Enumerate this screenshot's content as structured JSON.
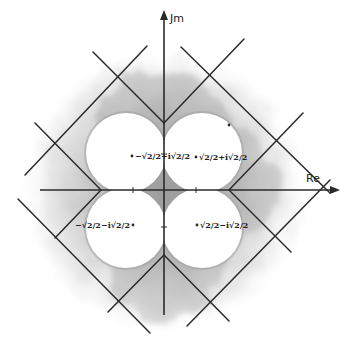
{
  "diagram": {
    "title": "",
    "colors": {
      "ink": "#2a2a2a",
      "wash": "#bdbdbd",
      "wash_dark": "#9a9a9a",
      "lobe": "#ffffff",
      "background": "#ffffff"
    },
    "origin": [
      164,
      190
    ],
    "axes": {
      "real": {
        "label": "Re",
        "from": [
          40,
          190
        ],
        "to": [
          340,
          190
        ],
        "label_pos": [
          306,
          182
        ]
      },
      "imag": {
        "label": "Jm",
        "from": [
          164,
          315
        ],
        "to": [
          164,
          10
        ],
        "label_pos": [
          170,
          22
        ]
      },
      "ticks": [
        {
          "axis": "real",
          "pos": [
            133,
            190
          ]
        },
        {
          "axis": "real",
          "pos": [
            196,
            190
          ]
        },
        {
          "axis": "imag",
          "pos": [
            164,
            154
          ]
        },
        {
          "axis": "imag",
          "pos": [
            164,
            227
          ]
        }
      ]
    },
    "v_vertices": [
      {
        "name": "top",
        "pos": [
          164,
          123
        ]
      },
      {
        "name": "left",
        "pos": [
          101,
          190
        ]
      },
      {
        "name": "right",
        "pos": [
          229,
          190
        ]
      },
      {
        "name": "bottom",
        "pos": [
          164,
          255
        ]
      }
    ],
    "lines": [
      {
        "name": "top-v-left-arm",
        "from": [
          164,
          123
        ],
        "to": [
          93,
          52
        ]
      },
      {
        "name": "top-v-right-arm",
        "from": [
          164,
          123
        ],
        "to": [
          244,
          39
        ]
      },
      {
        "name": "left-v-upper-arm",
        "from": [
          101,
          190
        ],
        "to": [
          35,
          123
        ]
      },
      {
        "name": "left-v-lower-arm",
        "from": [
          101,
          190
        ],
        "to": [
          55,
          238
        ]
      },
      {
        "name": "right-v-upper-arm",
        "from": [
          229,
          190
        ],
        "to": [
          303,
          113
        ]
      },
      {
        "name": "right-v-lower-arm",
        "from": [
          229,
          190
        ],
        "to": [
          291,
          252
        ]
      },
      {
        "name": "bottom-v-left-arm",
        "from": [
          164,
          255
        ],
        "to": [
          108,
          312
        ]
      },
      {
        "name": "bottom-v-right-arm",
        "from": [
          164,
          255
        ],
        "to": [
          229,
          321
        ]
      },
      {
        "name": "outer-top-left",
        "from": [
          147,
          46
        ],
        "to": [
          25,
          175
        ]
      },
      {
        "name": "outer-top-right",
        "from": [
          181,
          47
        ],
        "to": [
          330,
          193
        ]
      },
      {
        "name": "outer-bottom-left",
        "from": [
          18,
          199
        ],
        "to": [
          150,
          333
        ]
      },
      {
        "name": "outer-bottom-right",
        "from": [
          187,
          326
        ],
        "to": [
          330,
          180
        ]
      }
    ],
    "lobes": [
      {
        "name": "lobe-top-left",
        "cx": 126,
        "cy": 153,
        "r": 40
      },
      {
        "name": "lobe-top-right",
        "cx": 202,
        "cy": 153,
        "r": 40
      },
      {
        "name": "lobe-bottom-left",
        "cx": 126,
        "cy": 228,
        "r": 40
      },
      {
        "name": "lobe-bottom-right",
        "cx": 202,
        "cy": 228,
        "r": 40
      }
    ],
    "points": [
      {
        "name": "point-tl",
        "pos": [
          132,
          156
        ],
        "label": "−√2/2+i√2/2",
        "label_pos": [
          135,
          159
        ],
        "anchor": "start"
      },
      {
        "name": "point-tr",
        "pos": [
          196,
          157
        ],
        "label": "√2/2+i√2/2",
        "label_pos": [
          199,
          160
        ],
        "anchor": "start"
      },
      {
        "name": "point-bl",
        "pos": [
          133,
          225
        ],
        "label": "−√2/2−i√2/2",
        "label_pos": [
          130,
          228
        ],
        "anchor": "end"
      },
      {
        "name": "point-br",
        "pos": [
          197,
          225
        ],
        "label": "√2/2−i√2/2",
        "label_pos": [
          200,
          228
        ],
        "anchor": "start"
      },
      {
        "name": "point-stray",
        "pos": [
          229,
          125
        ],
        "label": "",
        "label_pos": [
          229,
          125
        ],
        "anchor": "start"
      }
    ]
  }
}
